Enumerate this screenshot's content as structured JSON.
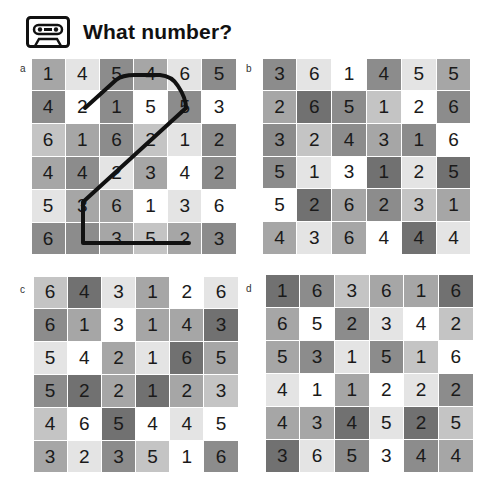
{
  "header": {
    "title": "What number?",
    "icon": "cassette-tape-icon"
  },
  "panels": [
    {
      "label": "a",
      "rows": [
        [
          "1",
          "4",
          "5",
          "4",
          "6",
          "5"
        ],
        [
          "4",
          "2",
          "1",
          "5",
          "5",
          "3"
        ],
        [
          "6",
          "1",
          "6",
          "2",
          "1",
          "2"
        ],
        [
          "4",
          "4",
          "2",
          "3",
          "4",
          "2"
        ],
        [
          "5",
          "3",
          "6",
          "1",
          "3",
          "6"
        ],
        [
          "6",
          "",
          "3",
          "5",
          "2",
          "3"
        ]
      ],
      "shades": [
        [
          3,
          1,
          4,
          3,
          1,
          4
        ],
        [
          4,
          0,
          4,
          0,
          4,
          0
        ],
        [
          2,
          3,
          4,
          2,
          1,
          4
        ],
        [
          3,
          4,
          1,
          3,
          0,
          4
        ],
        [
          1,
          3,
          3,
          0,
          1,
          0
        ],
        [
          4,
          4,
          3,
          2,
          3,
          4
        ]
      ],
      "traced_path": "2-shaped line from cell r2c2 up along row 1, down diagonally to r5c2, down to r6c2, right to r6c5"
    },
    {
      "label": "b",
      "rows": [
        [
          "3",
          "6",
          "1",
          "4",
          "5",
          "5"
        ],
        [
          "2",
          "6",
          "5",
          "1",
          "2",
          "6"
        ],
        [
          "3",
          "2",
          "4",
          "3",
          "1",
          "6"
        ],
        [
          "5",
          "1",
          "3",
          "1",
          "2",
          "5"
        ],
        [
          "5",
          "2",
          "6",
          "2",
          "3",
          "1"
        ],
        [
          "4",
          "3",
          "6",
          "4",
          "4",
          "4"
        ]
      ],
      "shades": [
        [
          4,
          1,
          0,
          4,
          1,
          3
        ],
        [
          3,
          5,
          4,
          2,
          0,
          4
        ],
        [
          4,
          2,
          4,
          3,
          4,
          0
        ],
        [
          4,
          1,
          0,
          5,
          1,
          5
        ],
        [
          0,
          5,
          3,
          4,
          2,
          3
        ],
        [
          3,
          1,
          3,
          0,
          5,
          1
        ]
      ]
    },
    {
      "label": "c",
      "rows": [
        [
          "6",
          "4",
          "3",
          "1",
          "2",
          "6"
        ],
        [
          "6",
          "1",
          "3",
          "1",
          "4",
          "3"
        ],
        [
          "5",
          "4",
          "2",
          "1",
          "6",
          "5"
        ],
        [
          "5",
          "2",
          "2",
          "1",
          "2",
          "3"
        ],
        [
          "4",
          "6",
          "5",
          "4",
          "4",
          "5"
        ],
        [
          "3",
          "2",
          "3",
          "5",
          "1",
          "6"
        ]
      ],
      "shades": [
        [
          2,
          5,
          1,
          3,
          0,
          1
        ],
        [
          4,
          3,
          0,
          3,
          3,
          5
        ],
        [
          1,
          0,
          3,
          1,
          5,
          3
        ],
        [
          4,
          5,
          3,
          5,
          3,
          2
        ],
        [
          2,
          0,
          5,
          0,
          1,
          0
        ],
        [
          3,
          1,
          4,
          2,
          0,
          4
        ]
      ]
    },
    {
      "label": "d",
      "rows": [
        [
          "1",
          "6",
          "3",
          "6",
          "1",
          "6"
        ],
        [
          "6",
          "5",
          "2",
          "3",
          "4",
          "2"
        ],
        [
          "5",
          "3",
          "1",
          "5",
          "1",
          "6"
        ],
        [
          "4",
          "1",
          "1",
          "2",
          "2",
          "2"
        ],
        [
          "4",
          "3",
          "4",
          "5",
          "2",
          "5"
        ],
        [
          "3",
          "6",
          "5",
          "3",
          "4",
          "4"
        ]
      ],
      "shades": [
        [
          5,
          4,
          2,
          3,
          3,
          5
        ],
        [
          3,
          0,
          4,
          1,
          0,
          2
        ],
        [
          3,
          4,
          1,
          4,
          2,
          0
        ],
        [
          1,
          0,
          3,
          0,
          1,
          4
        ],
        [
          3,
          3,
          5,
          1,
          5,
          2
        ],
        [
          5,
          1,
          4,
          0,
          4,
          3
        ]
      ]
    }
  ]
}
